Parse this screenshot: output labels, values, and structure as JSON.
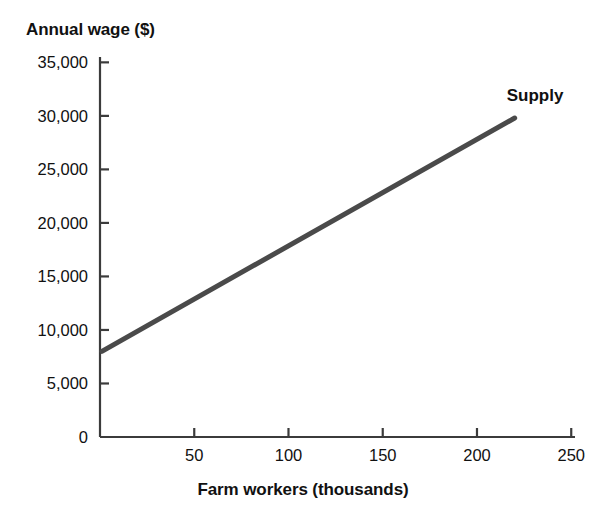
{
  "chart_data": {
    "type": "line",
    "title": "",
    "xlabel": "Farm workers (thousands)",
    "ylabel": "Annual wage ($)",
    "xlim": [
      0,
      252
    ],
    "ylim": [
      0,
      35500
    ],
    "grid": false,
    "legend_position": "inline-right",
    "x_ticks": [
      {
        "value": 50,
        "label": "50"
      },
      {
        "value": 100,
        "label": "100"
      },
      {
        "value": 150,
        "label": "150"
      },
      {
        "value": 200,
        "label": "200"
      },
      {
        "value": 250,
        "label": "250"
      }
    ],
    "y_ticks": [
      {
        "value": 0,
        "label": "0"
      },
      {
        "value": 5000,
        "label": "5,000"
      },
      {
        "value": 10000,
        "label": "10,000"
      },
      {
        "value": 15000,
        "label": "15,000"
      },
      {
        "value": 20000,
        "label": "20,000"
      },
      {
        "value": 25000,
        "label": "25,000"
      },
      {
        "value": 30000,
        "label": "30,000"
      },
      {
        "value": 35000,
        "label": "35,000"
      }
    ],
    "series": [
      {
        "name": "Supply",
        "color": "#4a4a4a",
        "line_width": 5,
        "label_text": "Supply",
        "label_x": 220,
        "label_y": 31800,
        "x": [
          1,
          220
        ],
        "values": [
          8000,
          29800
        ],
        "points": [
          {
            "x": 1,
            "y": 8000
          },
          {
            "x": 220,
            "y": 29800
          }
        ]
      }
    ],
    "axis_color": "#3b3b3b",
    "background_color": "#ffffff"
  }
}
